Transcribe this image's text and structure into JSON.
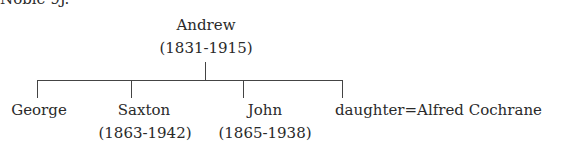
{
  "header_fragment": "Noble 9J.",
  "tree": {
    "root": {
      "name": "Andrew",
      "dates": "(1831-1915)"
    },
    "children": [
      {
        "name": "George",
        "dates": ""
      },
      {
        "name": "Saxton",
        "dates": "(1863-1942)"
      },
      {
        "name": "John",
        "dates": "(1865-1938)"
      },
      {
        "name": "daughter=Alfred Cochrane",
        "dates": ""
      }
    ]
  }
}
